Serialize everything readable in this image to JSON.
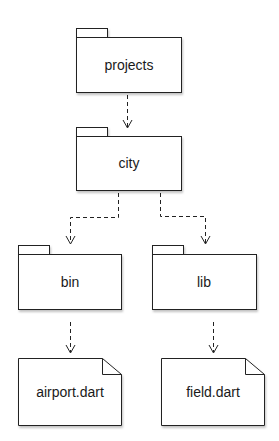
{
  "diagram": {
    "type": "package-dependency",
    "nodes": {
      "projects": {
        "label": "projects",
        "kind": "folder"
      },
      "city": {
        "label": "city",
        "kind": "folder"
      },
      "bin": {
        "label": "bin",
        "kind": "folder"
      },
      "lib": {
        "label": "lib",
        "kind": "folder"
      },
      "airport": {
        "label": "airport.dart",
        "kind": "file"
      },
      "field": {
        "label": "field.dart",
        "kind": "file"
      }
    },
    "edges": [
      {
        "from": "projects",
        "to": "city",
        "style": "dashed"
      },
      {
        "from": "city",
        "to": "bin",
        "style": "dashed"
      },
      {
        "from": "city",
        "to": "lib",
        "style": "dashed"
      },
      {
        "from": "bin",
        "to": "airport",
        "style": "dashed"
      },
      {
        "from": "lib",
        "to": "field",
        "style": "dashed"
      }
    ],
    "colors": {
      "stroke": "#222222",
      "fill": "#ffffff",
      "shadow": "#bbbbbb"
    }
  }
}
